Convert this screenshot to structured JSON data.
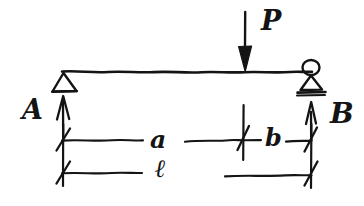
{
  "diagram": {
    "style": "hand-drawn pencil sketch on white paper",
    "ink_color": "#141414",
    "background_color": "#ffffff"
  },
  "labels": {
    "load": "P",
    "support_left": "A",
    "support_right": "B",
    "dim_a": "a",
    "dim_b": "b",
    "dim_total": "ℓ"
  },
  "elements": {
    "beam": {
      "name": "beam",
      "x_start": 62,
      "x_end": 312,
      "y": 72
    },
    "support_left": {
      "name": "pin-support",
      "type": "pin-triangle",
      "x": 63,
      "y": 72
    },
    "support_right": {
      "name": "roller-support",
      "type": "roller-circle-triangle",
      "x": 311,
      "y": 72
    },
    "load_arrow": {
      "name": "point-load-arrow",
      "direction": "down",
      "x": 245,
      "y_top": 12,
      "y_tip": 72
    },
    "reaction_left": {
      "name": "reaction-arrow-A",
      "direction": "up",
      "x": 63,
      "y_base": 140,
      "y_tip": 96
    },
    "reaction_right": {
      "name": "reaction-arrow-B",
      "direction": "up",
      "x": 311,
      "y_base": 140,
      "y_tip": 102
    }
  },
  "dimensions": {
    "upper_row_y": 140,
    "lower_row_y": 173,
    "ticks_x": [
      62,
      243,
      311
    ],
    "segments": [
      {
        "label": "a",
        "from_x": 62,
        "to_x": 243,
        "row": "upper"
      },
      {
        "label": "b",
        "from_x": 243,
        "to_x": 311,
        "row": "upper"
      },
      {
        "label": "ℓ",
        "from_x": 62,
        "to_x": 311,
        "row": "lower"
      }
    ]
  }
}
